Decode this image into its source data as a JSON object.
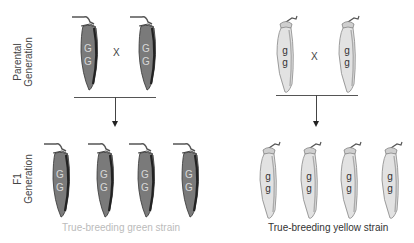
{
  "rows": {
    "parental_label": "Parental Generation",
    "parental_label_line1": "Parental",
    "parental_label_line2": "Generation",
    "f1_label_line1": "F1",
    "f1_label_line2": "Generation"
  },
  "cross_symbol": "X",
  "green_strain": {
    "caption": "True-breeding green strain",
    "caption_color": "#bbbbbb",
    "pod_color": "#7a7a7a",
    "allele_top": "G",
    "allele_bottom": "G",
    "parents": 2,
    "offspring": 4
  },
  "yellow_strain": {
    "caption": "True-breeding yellow strain",
    "caption_color": "#333333",
    "pod_color": "#e2e2e2",
    "allele_top": "g",
    "allele_bottom": "g",
    "parents": 2,
    "offspring": 4
  },
  "icons": {
    "green_pod": "pea-pod-green-icon",
    "yellow_pod": "pea-pod-yellow-icon",
    "arrow": "down-arrow-icon"
  }
}
